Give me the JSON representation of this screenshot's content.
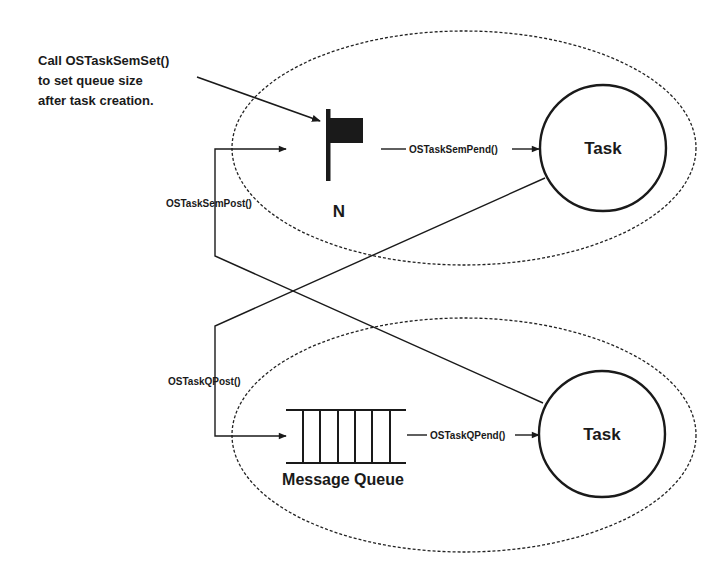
{
  "callout": {
    "lines": [
      "Call OSTaskSemSet()",
      "to set queue size",
      "after task creation."
    ]
  },
  "semaphore": {
    "label": "N"
  },
  "message_queue": {
    "label": "Message Queue",
    "slots": 6
  },
  "tasks": {
    "upper": {
      "label": "Task"
    },
    "lower": {
      "label": "Task"
    }
  },
  "functions": {
    "sem_pend": "OSTaskSemPend()",
    "sem_post": "OSTaskSemPost()",
    "q_post": "OSTaskQPost()",
    "q_pend": "OSTaskQPend()"
  },
  "colors": {
    "stroke": "#1a1a1a",
    "flag_fill": "#1a1a1a",
    "background": "#ffffff"
  }
}
